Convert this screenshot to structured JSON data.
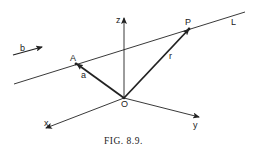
{
  "figure": {
    "caption": "FIG. 8.9.",
    "colors": {
      "ink": "#222222",
      "background": "#ffffff"
    },
    "points": {
      "origin": {
        "label": "O",
        "x": 124,
        "y": 98
      },
      "A": {
        "label": "A",
        "x": 76,
        "y": 64
      },
      "P": {
        "label": "P",
        "x": 189,
        "y": 29
      }
    },
    "axes": {
      "z": {
        "label": "z"
      },
      "x": {
        "label": "x"
      },
      "y": {
        "label": "y"
      }
    },
    "vectors": {
      "a": {
        "label": "a",
        "from": "origin",
        "to": "A"
      },
      "r": {
        "label": "r",
        "from": "origin",
        "to": "P"
      },
      "b": {
        "label": "b"
      }
    },
    "line": {
      "label": "L"
    }
  }
}
